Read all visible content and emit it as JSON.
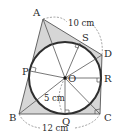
{
  "diagram": {
    "type": "quadrilateral with inscribed circle",
    "vertices": [
      {
        "name": "A",
        "x": 43,
        "y": 19,
        "label_x": 33,
        "label_y": 16
      },
      {
        "name": "D",
        "x": 102,
        "y": 55,
        "label_x": 104,
        "label_y": 57
      },
      {
        "name": "C",
        "x": 100,
        "y": 114,
        "label_x": 104,
        "label_y": 121
      },
      {
        "name": "B",
        "x": 19,
        "y": 114,
        "label_x": 9,
        "label_y": 121
      }
    ],
    "center": {
      "name": "O",
      "x": 65,
      "y": 78,
      "label_x": 68,
      "label_y": 82
    },
    "radius": 36,
    "tangent_points": [
      {
        "name": "P",
        "x": 30,
        "y": 71,
        "label_x": 22,
        "label_y": 75
      },
      {
        "name": "S",
        "x": 80,
        "y": 43,
        "label_x": 82,
        "label_y": 41
      },
      {
        "name": "R",
        "x": 101,
        "y": 78,
        "label_x": 104,
        "label_y": 82
      },
      {
        "name": "Q",
        "x": 65,
        "y": 114,
        "label_x": 62,
        "label_y": 125
      }
    ],
    "measurements": [
      {
        "label": "10 cm",
        "x": 68,
        "y": 26,
        "segment": "AD"
      },
      {
        "label": "12 cm",
        "x": 42,
        "y": 131,
        "segment": "BC"
      },
      {
        "label": "5 cm",
        "x": 44,
        "y": 101,
        "segment": "OQ (radius)"
      }
    ],
    "colors": {
      "fill": "#d6d6d6",
      "circle": "#2e2e2e",
      "lines": "#555555",
      "dashed": "#777777"
    }
  }
}
